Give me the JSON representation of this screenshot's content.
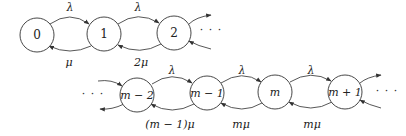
{
  "diagram": {
    "type": "birth-death-markov-chain",
    "top_row": {
      "nodes": [
        {
          "id": "0",
          "label": "0"
        },
        {
          "id": "1",
          "label": "1"
        },
        {
          "id": "2",
          "label": "2"
        }
      ],
      "forward_rates": [
        "λ",
        "λ"
      ],
      "backward_rates": [
        "μ",
        "2μ"
      ],
      "continuation": "· · ·"
    },
    "bottom_row": {
      "leading_continuation": "· · ·",
      "nodes": [
        {
          "id": "m-2",
          "label": "m − 2"
        },
        {
          "id": "m-1",
          "label": "m − 1"
        },
        {
          "id": "m",
          "label": "m"
        },
        {
          "id": "m+1",
          "label": "m + 1"
        }
      ],
      "forward_rates": [
        "λ",
        "λ",
        "λ"
      ],
      "backward_rates": [
        "(m − 1)μ",
        "mμ",
        "mμ"
      ],
      "continuation": "· · ·"
    }
  }
}
